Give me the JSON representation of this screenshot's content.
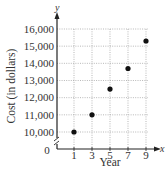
{
  "chart_data": {
    "type": "scatter",
    "title": "",
    "xlabel": "Year",
    "ylabel": "Cost (in dollars)",
    "x_axis_letter": "x",
    "y_axis_letter": "y",
    "origin_label": "0",
    "x_ticks": [
      1,
      3,
      5,
      7,
      9
    ],
    "x_tick_labels": [
      "1",
      "3",
      "5",
      "7",
      "9"
    ],
    "y_ticks": [
      10000,
      11000,
      12000,
      13000,
      14000,
      15000,
      16000
    ],
    "y_tick_labels": [
      "10,000",
      "11,000",
      "12,000",
      "13,000",
      "14,000",
      "15,000",
      "16,000"
    ],
    "xlim": [
      0,
      10
    ],
    "ylim": [
      9500,
      16500
    ],
    "y_axis_break": true,
    "grid": true,
    "legend": null,
    "series": [
      {
        "name": "Cost",
        "x": [
          1,
          3,
          5,
          7,
          9
        ],
        "y": [
          10000,
          11000,
          12500,
          13700,
          15300
        ]
      }
    ],
    "colors": {
      "points": "#111111",
      "grid": "#9a9a9a",
      "axis": "#222222"
    }
  }
}
